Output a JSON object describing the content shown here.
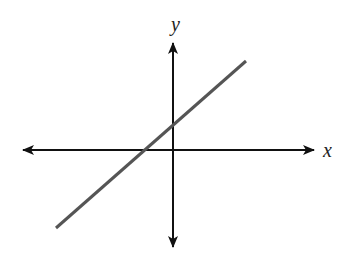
{
  "diagram": {
    "type": "coordinate-plane-line",
    "x_axis_label": "x",
    "y_axis_label": "y",
    "colors": {
      "axes": "#111111",
      "line": "#555555",
      "labels": "#222222",
      "background": "#ffffff"
    },
    "origin_px": [
      173,
      150
    ],
    "x_axis_px": {
      "start": [
        22,
        150
      ],
      "end": [
        315,
        150
      ]
    },
    "y_axis_px": {
      "start": [
        173,
        42
      ],
      "end": [
        173,
        248
      ]
    },
    "line_px": {
      "start": [
        56,
        228
      ],
      "end": [
        246,
        61
      ]
    },
    "line_properties": {
      "slope": "positive",
      "x_intercept": "negative",
      "y_intercept": "positive"
    }
  }
}
